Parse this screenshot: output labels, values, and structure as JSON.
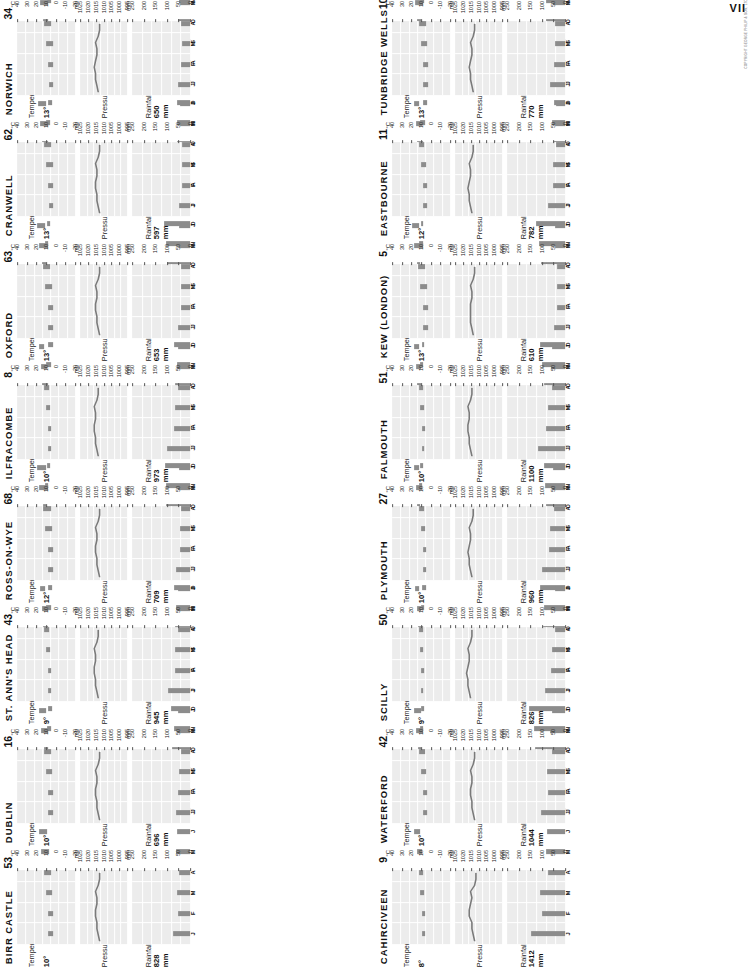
{
  "page": {
    "corner_mark": "VII",
    "credit": "COPYRIGHT GEORGE PHILIP & SON, LTD.",
    "columns": 2,
    "rows": 8,
    "colors": {
      "bar": "#8c8c8c",
      "chart_bg": "#ececec",
      "grid": "#ffffff",
      "text": "#111111",
      "line": "#7a7a7a"
    },
    "panel_titles": {
      "temperature": "Temperature",
      "pressure": "Pressure",
      "rainfall": "Rainfall"
    },
    "units": {
      "temperature": "°C",
      "pressure": "mb",
      "rainfall": "mm"
    },
    "month_letters": [
      "J",
      "F",
      "M",
      "A",
      "M",
      "J",
      "J",
      "A",
      "S",
      "O",
      "N",
      "D"
    ],
    "temperature_ticks": [
      "40",
      "30",
      "20",
      "10",
      "0",
      "-10",
      "-20"
    ],
    "pressure_ticks": [
      "1025",
      "1020",
      "1015",
      "1010",
      "1005",
      "1000",
      "995"
    ],
    "rainfall_ticks": [
      "250",
      "200",
      "150",
      "100",
      "50",
      "0"
    ],
    "temperature_axis": {
      "min": -25,
      "max": 45
    },
    "pressure_axis": {
      "min": 992.5,
      "max": 1027.5
    },
    "rainfall_axis": {
      "min": 0,
      "max": 275
    }
  },
  "chart_data": {
    "type": "bar",
    "xlabel": "Month",
    "ylabel": "",
    "categories": [
      "J",
      "F",
      "M",
      "A",
      "M",
      "J",
      "J",
      "A",
      "S",
      "O",
      "N",
      "D"
    ],
    "stations": [
      {
        "name": "BIRR CASTLE",
        "number": "53",
        "mean_temp": "10°",
        "annual_rainfall": "828 mm",
        "temp_min": [
          2,
          2,
          3,
          4,
          6,
          9,
          11,
          11,
          9,
          7,
          4,
          3
        ],
        "temp_max": [
          7,
          8,
          10,
          13,
          16,
          19,
          19,
          19,
          17,
          13,
          9,
          8
        ],
        "pressure": [
          1013,
          1014,
          1015,
          1015,
          1016,
          1016,
          1015,
          1015,
          1016,
          1014,
          1013,
          1013
        ],
        "rainfall": [
          80,
          58,
          62,
          54,
          66,
          60,
          74,
          86,
          76,
          84,
          76,
          92
        ]
      },
      {
        "name": "DUBLIN",
        "number": "16",
        "mean_temp": "10°",
        "annual_rainfall": "696 mm",
        "temp_min": [
          2,
          2,
          3,
          4,
          7,
          10,
          12,
          12,
          10,
          7,
          4,
          3
        ],
        "temp_max": [
          8,
          8,
          10,
          13,
          16,
          19,
          19,
          19,
          17,
          14,
          10,
          8
        ],
        "pressure": [
          1013,
          1014,
          1015,
          1015,
          1016,
          1016,
          1015,
          1015,
          1016,
          1014,
          1013,
          1013
        ],
        "rainfall": [
          67,
          55,
          51,
          45,
          60,
          57,
          70,
          74,
          72,
          70,
          67,
          74
        ]
      },
      {
        "name": "ST. ANN'S HEAD",
        "number": "43",
        "mean_temp": "9°",
        "annual_rainfall": "945 mm",
        "temp_min": [
          4,
          4,
          5,
          6,
          8,
          11,
          13,
          13,
          12,
          10,
          7,
          5
        ],
        "temp_max": [
          8,
          8,
          10,
          12,
          15,
          17,
          18,
          18,
          17,
          14,
          11,
          9
        ],
        "pressure": [
          1014,
          1015,
          1016,
          1016,
          1017,
          1017,
          1016,
          1016,
          1017,
          1015,
          1014,
          1014
        ],
        "rainfall": [
          104,
          73,
          69,
          56,
          62,
          56,
          74,
          86,
          86,
          112,
          112,
          120
        ]
      },
      {
        "name": "ROSS-ON-WYE",
        "number": "68",
        "mean_temp": "12°",
        "annual_rainfall": "709 mm",
        "temp_min": [
          1,
          1,
          3,
          4,
          7,
          10,
          12,
          12,
          10,
          7,
          4,
          2
        ],
        "temp_max": [
          7,
          8,
          11,
          14,
          18,
          21,
          22,
          22,
          19,
          15,
          10,
          8
        ],
        "pressure": [
          1013,
          1014,
          1015,
          1015,
          1016,
          1016,
          1015,
          1015,
          1016,
          1014,
          1013,
          1013
        ],
        "rainfall": [
          66,
          48,
          47,
          44,
          57,
          53,
          62,
          72,
          62,
          70,
          62,
          76
        ]
      },
      {
        "name": "ILFRACOMBE",
        "number": "8",
        "mean_temp": "10°",
        "annual_rainfall": "973 mm",
        "temp_min": [
          4,
          4,
          5,
          6,
          9,
          12,
          14,
          14,
          12,
          10,
          7,
          5
        ],
        "temp_max": [
          8,
          8,
          10,
          13,
          16,
          18,
          19,
          19,
          18,
          15,
          11,
          9
        ],
        "pressure": [
          1014,
          1015,
          1016,
          1016,
          1017,
          1017,
          1016,
          1016,
          1017,
          1015,
          1014,
          1014
        ],
        "rainfall": [
          110,
          78,
          70,
          57,
          62,
          55,
          70,
          82,
          82,
          110,
          116,
          122
        ]
      },
      {
        "name": "OXFORD",
        "number": "63",
        "mean_temp": "13°",
        "annual_rainfall": "653 mm",
        "temp_min": [
          2,
          2,
          3,
          5,
          8,
          11,
          13,
          13,
          11,
          8,
          5,
          3
        ],
        "temp_max": [
          7,
          8,
          11,
          14,
          18,
          21,
          23,
          22,
          19,
          15,
          10,
          8
        ],
        "pressure": [
          1013,
          1014,
          1015,
          1015,
          1016,
          1016,
          1015,
          1015,
          1016,
          1014,
          1013,
          1013
        ],
        "rainfall": [
          56,
          42,
          42,
          42,
          53,
          50,
          58,
          62,
          55,
          64,
          60,
          62
        ]
      },
      {
        "name": "CRANWELL",
        "number": "62",
        "mean_temp": "13°",
        "annual_rainfall": "597 mm",
        "temp_min": [
          1,
          1,
          2,
          4,
          7,
          10,
          12,
          12,
          10,
          7,
          4,
          2
        ],
        "temp_max": [
          6,
          7,
          10,
          13,
          17,
          20,
          22,
          21,
          19,
          14,
          9,
          7
        ],
        "pressure": [
          1013,
          1014,
          1015,
          1015,
          1016,
          1016,
          1015,
          1015,
          1016,
          1014,
          1013,
          1013
        ],
        "rainfall": [
          50,
          38,
          38,
          40,
          48,
          48,
          58,
          60,
          50,
          56,
          54,
          57
        ]
      },
      {
        "name": "NORWICH",
        "number": "34",
        "mean_temp": "13°",
        "annual_rainfall": "650 mm",
        "temp_min": [
          1,
          1,
          2,
          4,
          7,
          11,
          13,
          13,
          11,
          8,
          5,
          3
        ],
        "temp_max": [
          6,
          7,
          10,
          13,
          17,
          20,
          22,
          21,
          19,
          15,
          10,
          7
        ],
        "pressure": [
          1014,
          1015,
          1016,
          1016,
          1017,
          1016,
          1015,
          1015,
          1016,
          1014,
          1013,
          1013
        ],
        "rainfall": [
          57,
          42,
          40,
          43,
          48,
          52,
          60,
          64,
          54,
          62,
          62,
          60
        ]
      },
      {
        "name": "CAHIRCIVEEN",
        "number": "9",
        "mean_temp": "8°",
        "annual_rainfall": "1412 mm",
        "temp_min": [
          5,
          5,
          6,
          7,
          9,
          11,
          13,
          13,
          12,
          10,
          7,
          6
        ],
        "temp_max": [
          9,
          9,
          11,
          13,
          15,
          18,
          18,
          19,
          17,
          14,
          11,
          10
        ],
        "pressure": [
          1013,
          1014,
          1015,
          1015,
          1017,
          1017,
          1016,
          1015,
          1016,
          1013,
          1012,
          1012
        ],
        "rainfall": [
          160,
          110,
          118,
          80,
          90,
          86,
          104,
          122,
          122,
          142,
          148,
          170
        ]
      },
      {
        "name": "WATERFORD",
        "number": "42",
        "mean_temp": "10°",
        "annual_rainfall": "1044 mm",
        "temp_min": [
          3,
          3,
          4,
          5,
          7,
          10,
          12,
          12,
          11,
          8,
          6,
          4
        ],
        "temp_max": [
          8,
          8,
          10,
          13,
          16,
          19,
          19,
          19,
          17,
          14,
          10,
          9
        ],
        "pressure": [
          1013,
          1014,
          1015,
          1015,
          1016,
          1016,
          1015,
          1015,
          1016,
          1014,
          1013,
          1013
        ],
        "rainfall": [
          115,
          82,
          84,
          62,
          72,
          63,
          82,
          94,
          88,
          106,
          100,
          120
        ]
      },
      {
        "name": "SCILLY",
        "number": "50",
        "mean_temp": "9°",
        "annual_rainfall": "826 mm",
        "temp_min": [
          7,
          6,
          7,
          8,
          10,
          12,
          14,
          15,
          14,
          11,
          9,
          8
        ],
        "temp_max": [
          10,
          10,
          11,
          12,
          15,
          17,
          18,
          19,
          18,
          15,
          13,
          11
        ],
        "pressure": [
          1016,
          1017,
          1018,
          1018,
          1019,
          1018,
          1017,
          1017,
          1018,
          1016,
          1015,
          1015
        ],
        "rainfall": [
          93,
          66,
          60,
          46,
          52,
          48,
          61,
          70,
          68,
          92,
          95,
          100
        ]
      },
      {
        "name": "PLYMOUTH",
        "number": "27",
        "mean_temp": "10°",
        "annual_rainfall": "960 mm",
        "temp_min": [
          4,
          4,
          5,
          6,
          9,
          12,
          14,
          14,
          12,
          10,
          7,
          6
        ],
        "temp_max": [
          8,
          8,
          10,
          13,
          16,
          19,
          20,
          20,
          18,
          15,
          11,
          9
        ],
        "pressure": [
          1015,
          1016,
          1017,
          1017,
          1018,
          1017,
          1016,
          1016,
          1017,
          1015,
          1014,
          1014
        ],
        "rainfall": [
          108,
          78,
          72,
          53,
          62,
          56,
          70,
          78,
          78,
          98,
          108,
          118
        ]
      },
      {
        "name": "FALMOUTH",
        "number": "51",
        "mean_temp": "10°",
        "annual_rainfall": "1100 mm",
        "temp_min": [
          6,
          5,
          6,
          7,
          10,
          12,
          14,
          15,
          13,
          11,
          8,
          7
        ],
        "temp_max": [
          9,
          9,
          11,
          13,
          16,
          19,
          19,
          20,
          18,
          15,
          12,
          10
        ],
        "pressure": [
          1015,
          1016,
          1017,
          1017,
          1018,
          1018,
          1017,
          1017,
          1018,
          1016,
          1015,
          1015
        ],
        "rainfall": [
          128,
          92,
          82,
          60,
          68,
          60,
          76,
          88,
          88,
          112,
          124,
          138
        ]
      },
      {
        "name": "KEW (LONDON)",
        "number": "5",
        "mean_temp": "13°",
        "annual_rainfall": "610 mm",
        "temp_min": [
          2,
          2,
          3,
          5,
          8,
          12,
          14,
          13,
          12,
          8,
          5,
          3
        ],
        "temp_max": [
          7,
          8,
          11,
          14,
          18,
          21,
          23,
          22,
          20,
          15,
          11,
          8
        ],
        "pressure": [
          1014,
          1015,
          1016,
          1016,
          1016,
          1016,
          1015,
          1015,
          1016,
          1014,
          1013,
          1013
        ],
        "rainfall": [
          54,
          40,
          37,
          38,
          46,
          46,
          58,
          58,
          50,
          58,
          62,
          52
        ]
      },
      {
        "name": "EASTBOURNE",
        "number": "11",
        "mean_temp": "12°",
        "annual_rainfall": "782 mm",
        "temp_min": [
          3,
          3,
          4,
          6,
          9,
          12,
          14,
          14,
          13,
          10,
          6,
          4
        ],
        "temp_max": [
          7,
          7,
          10,
          12,
          16,
          19,
          20,
          20,
          18,
          15,
          11,
          9
        ],
        "pressure": [
          1015,
          1016,
          1017,
          1017,
          1018,
          1017,
          1016,
          1016,
          1017,
          1015,
          1014,
          1014
        ],
        "rainfall": [
          82,
          58,
          56,
          44,
          48,
          44,
          56,
          62,
          66,
          92,
          92,
          94
        ]
      },
      {
        "name": "TUNBRIDGE WELLS",
        "number": "107",
        "mean_temp": "13°",
        "annual_rainfall": "770 mm",
        "temp_min": [
          1,
          1,
          3,
          4,
          7,
          11,
          13,
          12,
          11,
          8,
          4,
          3
        ],
        "temp_max": [
          7,
          7,
          10,
          13,
          17,
          20,
          22,
          22,
          19,
          15,
          10,
          8
        ],
        "pressure": [
          1014,
          1015,
          1016,
          1016,
          1017,
          1016,
          1015,
          1015,
          1016,
          1014,
          1013,
          1013
        ],
        "rainfall": [
          72,
          52,
          48,
          46,
          56,
          50,
          62,
          66,
          60,
          78,
          78,
          82
        ]
      }
    ]
  }
}
